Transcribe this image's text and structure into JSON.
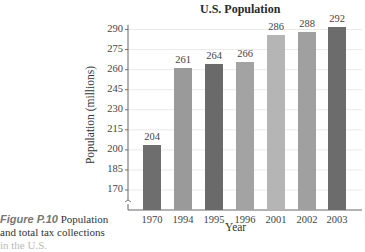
{
  "chart_data": {
    "type": "bar",
    "title": "U.S. Population",
    "xlabel": "Year",
    "ylabel": "Population (millions)",
    "categories": [
      "1970",
      "1994",
      "1995",
      "1996",
      "2001",
      "2002",
      "2003"
    ],
    "values": [
      204,
      261,
      264,
      266,
      286,
      288,
      292
    ],
    "data_labels": [
      "204",
      "261",
      "264",
      "266",
      "286",
      "288",
      "292"
    ],
    "yticks": [
      170,
      185,
      200,
      215,
      230,
      245,
      260,
      275,
      290
    ],
    "ylim": [
      155,
      292
    ],
    "axis_break": true,
    "grid": true,
    "legend": null,
    "bar_colors": [
      "#6e6e6e",
      "#9a9a9a",
      "#6a6a6a",
      "#a3a3a3",
      "#b5b5b5",
      "#a0a0a0",
      "#6c6c6c"
    ]
  },
  "caption": {
    "figure_label": "Figure P.10",
    "line1_rest": "Population",
    "line2": "and total tax collections",
    "line3_partial": "in the U.S."
  }
}
